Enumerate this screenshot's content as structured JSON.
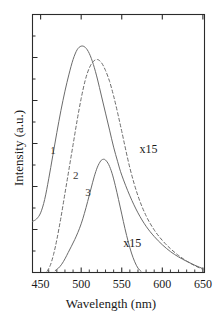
{
  "chart_data": {
    "type": "line",
    "title": "",
    "xlabel": "Wavelength (nm)",
    "ylabel": "Intensity (a.u.)",
    "xlim": [
      440,
      652
    ],
    "ylim": [
      0,
      1.06
    ],
    "xticks": [
      450,
      500,
      550,
      600,
      650
    ],
    "xticklabels": [
      "450",
      "500",
      "550",
      "600",
      "650"
    ],
    "yticks": [],
    "yticklabels": [],
    "minor_tick_step": 10,
    "grid": false,
    "legend": "none",
    "series": [
      {
        "name": "1",
        "label": "1",
        "style": "solid",
        "color": "#6b6b6b",
        "peak_x": 500,
        "peak_y": 0.93,
        "label_x": 462,
        "label_y": 0.5,
        "x": [
          440,
          445,
          450,
          455,
          460,
          465,
          470,
          475,
          480,
          485,
          490,
          495,
          500,
          505,
          510,
          515,
          520,
          525,
          530,
          535,
          540,
          545,
          550,
          560,
          570,
          580,
          590,
          600,
          610,
          620,
          630,
          640,
          650
        ],
        "y": [
          0.21,
          0.22,
          0.245,
          0.3,
          0.385,
          0.48,
          0.575,
          0.665,
          0.745,
          0.815,
          0.875,
          0.915,
          0.93,
          0.925,
          0.9,
          0.855,
          0.795,
          0.725,
          0.655,
          0.585,
          0.515,
          0.455,
          0.4,
          0.315,
          0.245,
          0.19,
          0.148,
          0.114,
          0.086,
          0.064,
          0.046,
          0.03,
          0.016
        ]
      },
      {
        "name": "2",
        "label": "2",
        "style": "dashed",
        "color": "#6b6b6b",
        "peak_x": 521,
        "peak_y": 0.875,
        "label_x": 490,
        "label_y": 0.395,
        "x": [
          458,
          462,
          466,
          470,
          475,
          480,
          485,
          490,
          495,
          500,
          505,
          510,
          515,
          520,
          525,
          530,
          535,
          540,
          545,
          550,
          560,
          570,
          580,
          590,
          600,
          610,
          620,
          630,
          640,
          650
        ],
        "y": [
          0.005,
          0.03,
          0.075,
          0.135,
          0.225,
          0.325,
          0.425,
          0.525,
          0.625,
          0.715,
          0.79,
          0.84,
          0.867,
          0.875,
          0.862,
          0.83,
          0.785,
          0.725,
          0.655,
          0.58,
          0.43,
          0.315,
          0.233,
          0.175,
          0.132,
          0.098,
          0.07,
          0.047,
          0.028,
          0.013
        ]
      },
      {
        "name": "3",
        "label": "3",
        "style": "solid",
        "color": "#6b6b6b",
        "peak_x": 527,
        "peak_y": 0.465,
        "label_x": 505,
        "label_y": 0.325,
        "x": [
          468,
          472,
          476,
          480,
          484,
          488,
          492,
          496,
          500,
          504,
          508,
          512,
          516,
          520,
          524,
          527,
          530,
          534,
          538,
          542,
          546,
          550,
          554,
          558,
          562,
          566,
          570,
          574
        ],
        "y": [
          0.008,
          0.018,
          0.034,
          0.056,
          0.082,
          0.108,
          0.135,
          0.165,
          0.2,
          0.243,
          0.292,
          0.343,
          0.393,
          0.433,
          0.458,
          0.465,
          0.462,
          0.443,
          0.408,
          0.358,
          0.3,
          0.24,
          0.18,
          0.126,
          0.08,
          0.044,
          0.018,
          0.004
        ]
      }
    ],
    "annotations": [
      {
        "text": "x15",
        "x": 572,
        "y": 0.505,
        "name": "scale-annotation-upper"
      },
      {
        "text": "x15",
        "x": 552,
        "y": 0.118,
        "name": "scale-annotation-lower"
      }
    ]
  }
}
